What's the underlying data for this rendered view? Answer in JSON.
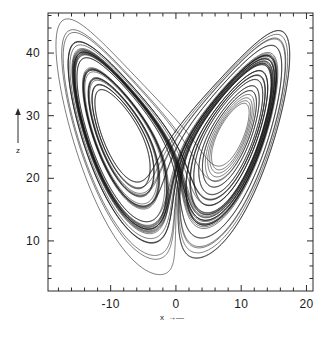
{
  "figure": {
    "background_color": "#ffffff",
    "line_color": "#111111",
    "axis_color": "#2b2b2b",
    "width": 331,
    "height": 337
  },
  "axes": {
    "frame": {
      "left": 48,
      "top": 13,
      "right": 313,
      "bottom": 291
    },
    "x_axis": {
      "label": "x",
      "arrow": "⟶",
      "min": -19.6,
      "max": 21.0,
      "tick_labels": [
        "-10",
        "0",
        "10",
        "20"
      ],
      "tick_values": [
        -10,
        0,
        10,
        20
      ],
      "minor_tick_step": 2
    },
    "z_axis": {
      "label": "z",
      "arrow": "↑",
      "min": 2.0,
      "max": 46.4,
      "tick_labels": [
        "10",
        "20",
        "30",
        "40"
      ],
      "tick_values": [
        10,
        20,
        30,
        40
      ],
      "minor_tick_step": 2
    }
  },
  "chart_data": {
    "type": "line",
    "title": "",
    "subtitle": "",
    "xlabel": "x",
    "ylabel": "z",
    "xlim": [
      -19.6,
      21.0
    ],
    "ylim": [
      2.0,
      46.4
    ],
    "grid": false,
    "legend": null,
    "annotations": [],
    "system": {
      "name": "Lorenz equations",
      "equations": [
        "dx/dt = sigma*(y - x)",
        "dy/dt = x*(rho - z) - y",
        "dz/dt = x*y - beta*z"
      ],
      "sigma": 10.0,
      "rho": 28.0,
      "beta": 2.6666666666666665
    },
    "integration": {
      "method": "rk4",
      "dt": 0.0045,
      "steps": 13500,
      "transient_skip": 600,
      "initial_conditions": {
        "x": 0.9,
        "y": 1.4,
        "z": 13.0
      }
    },
    "fixed_points": [
      {
        "x": -8.485,
        "z": 27.0
      },
      {
        "x": 8.485,
        "z": 27.0
      },
      {
        "x": 0.0,
        "z": 0.0
      }
    ],
    "observed_extent": {
      "x_min": -17.8,
      "x_max": 18.4,
      "z_min": 5.3,
      "z_max": 45.2
    },
    "series": [
      {
        "name": "trajectory",
        "plot_as": "parametric-curve",
        "x_key": "x",
        "y_key": "z",
        "color": "#111111",
        "linewidth": 0.55
      }
    ]
  }
}
